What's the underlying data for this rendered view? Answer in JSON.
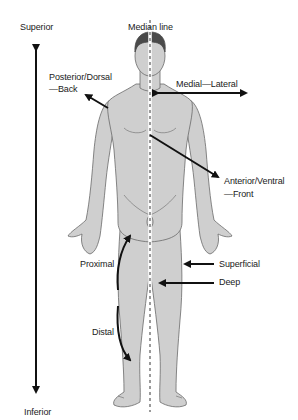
{
  "diagram": {
    "type": "anatomical-directional-terms",
    "labels": {
      "superior": "Superior",
      "inferior": "Inferior",
      "median_line": "Median line",
      "posterior_line1": "Posterior/Dorsal",
      "posterior_line2": "—Back",
      "medial_lateral": "Medial—Lateral",
      "anterior_line1": "Anterior/Ventral",
      "anterior_line2": "—Front",
      "proximal": "Proximal",
      "distal": "Distal",
      "superficial": "Superficial",
      "deep": "Deep"
    },
    "colors": {
      "body_fill": "#cfcfcf",
      "body_outline": "#6a6a6a",
      "hair": "#4a4a4a",
      "arrows": "#111111",
      "median_line": "#e8e8e8",
      "text": "#1a1a1a"
    }
  }
}
